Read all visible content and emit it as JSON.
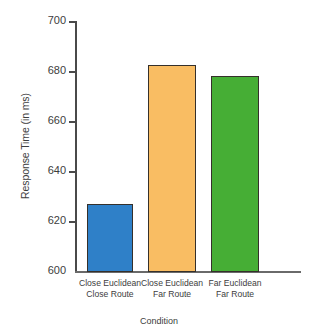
{
  "chart_data": {
    "type": "bar",
    "title": "",
    "xlabel": "Condition",
    "ylabel": "Response Time (in ms)",
    "categories": [
      "Close Euclidean Close Route",
      "Close Euclidean Far Route",
      "Far Euclidean Far Route"
    ],
    "category_lines": [
      [
        "Close Euclidean",
        "Close Route"
      ],
      [
        "Close Euclidean",
        "Far Route"
      ],
      [
        "Far Euclidean",
        "Far Route"
      ]
    ],
    "values": [
      627,
      682.5,
      678
    ],
    "ylim": [
      600,
      700
    ],
    "yticks": [
      600,
      620,
      640,
      660,
      680,
      700
    ],
    "ytick_labels": [
      "600",
      "620",
      "640",
      "660",
      "680",
      "700"
    ],
    "grid": false,
    "legend": "none",
    "bar_colors": [
      "#2f80c8",
      "#f9bd63",
      "#46ae35"
    ],
    "bar_edge_color": "#35302b",
    "axis_color": "#4a4a4a"
  }
}
